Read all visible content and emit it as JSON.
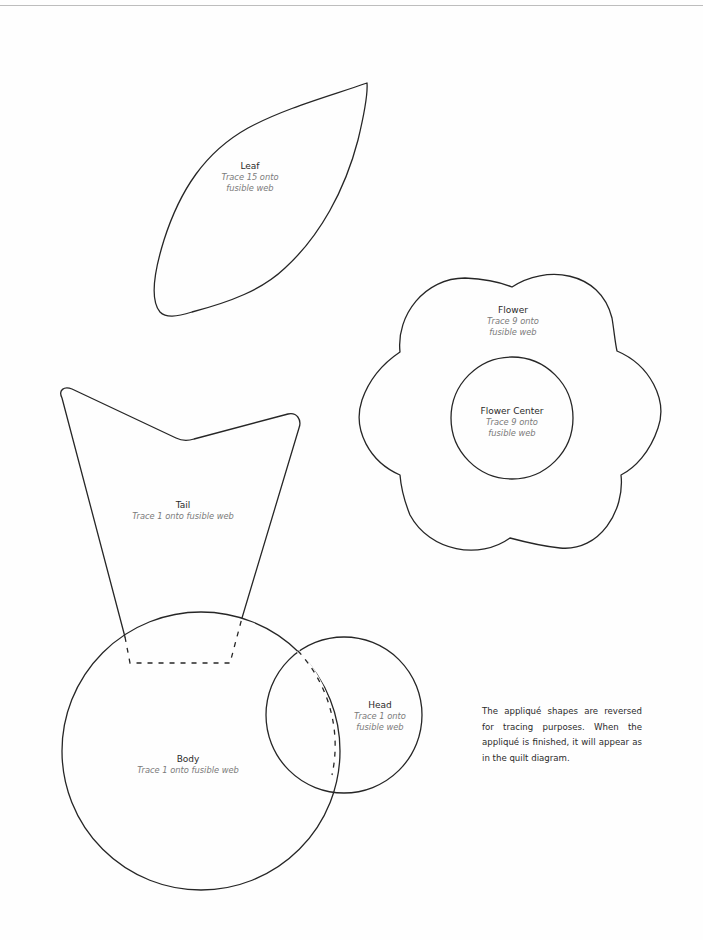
{
  "document": {
    "note": "The appliqué shapes are reversed for tracing purposes. When the appliqué is finished, it will appear as in the quilt diagram."
  },
  "pieces": {
    "leaf": {
      "name": "Leaf",
      "instructions": [
        "Trace 15 onto",
        "fusible web"
      ]
    },
    "flower": {
      "name": "Flower",
      "instructions": [
        "Trace 9 onto",
        "fusible web"
      ]
    },
    "flower_center": {
      "name": "Flower Center",
      "instructions": [
        "Trace 9 onto",
        "fusible web"
      ]
    },
    "tail": {
      "name": "Tail",
      "instructions": [
        "Trace 1 onto fusible web"
      ]
    },
    "head": {
      "name": "Head",
      "instructions": [
        "Trace 1 onto",
        "fusible web"
      ]
    },
    "body": {
      "name": "Body",
      "instructions": [
        "Trace 1 onto fusible web"
      ]
    }
  },
  "colors": {
    "outline": "#262626",
    "label": "#2a2a2a",
    "instruction": "#7a7a7a"
  }
}
